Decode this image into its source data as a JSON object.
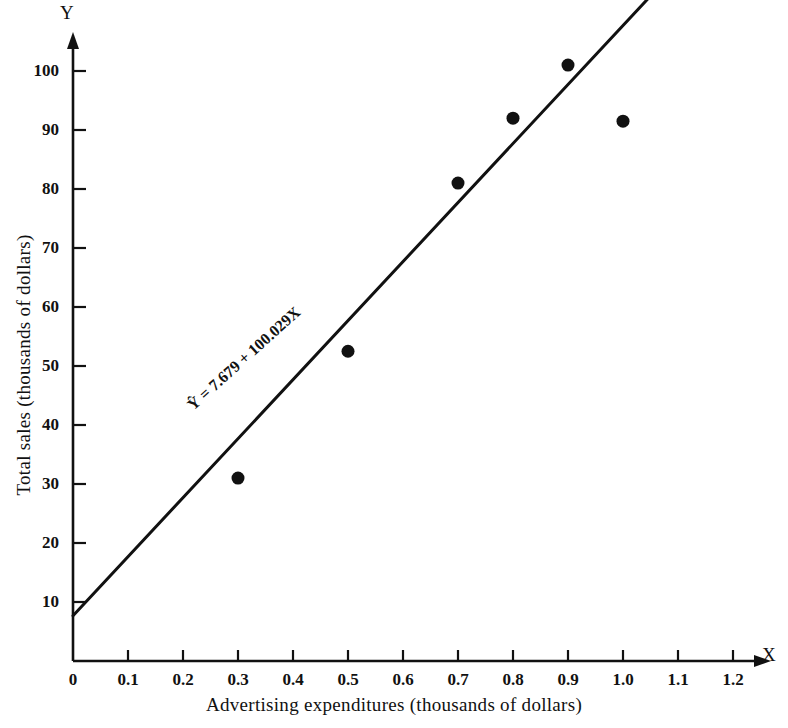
{
  "chart_data": {
    "type": "scatter",
    "title": "",
    "xlabel": "Advertising expenditures (thousands of dollars)",
    "ylabel": "Total sales (thousands of dollars)",
    "x_axis_letter": "X",
    "y_axis_letter": "Y",
    "xlim": [
      0,
      1.2
    ],
    "ylim": [
      0,
      107
    ],
    "grid": false,
    "legend": "none",
    "x_ticks": [
      "0",
      "0.1",
      "0.2",
      "0.3",
      "0.4",
      "0.5",
      "0.6",
      "0.7",
      "0.8",
      "0.9",
      "1.0",
      "1.1",
      "1.2"
    ],
    "x_tick_values": [
      0,
      0.1,
      0.2,
      0.3,
      0.4,
      0.5,
      0.6,
      0.7,
      0.8,
      0.9,
      1.0,
      1.1,
      1.2
    ],
    "y_ticks": [
      "10",
      "20",
      "30",
      "40",
      "50",
      "60",
      "70",
      "80",
      "90",
      "100"
    ],
    "y_tick_values": [
      10,
      20,
      30,
      40,
      50,
      60,
      70,
      80,
      90,
      100
    ],
    "points": [
      {
        "x": 0.3,
        "y": 31.0
      },
      {
        "x": 0.5,
        "y": 52.5
      },
      {
        "x": 0.7,
        "y": 81.0
      },
      {
        "x": 0.8,
        "y": 92.0
      },
      {
        "x": 0.9,
        "y": 101.0
      },
      {
        "x": 1.0,
        "y": 91.5
      }
    ],
    "fit_line": {
      "label": "Ŷ = 7.679 + 100.029X",
      "intercept": 7.679,
      "slope": 100.029,
      "x_start": 0.0,
      "x_end": 1.05
    },
    "marker_color": "#111111",
    "line_color": "#111111",
    "axis_color": "#111111",
    "background_color": "#ffffff"
  }
}
